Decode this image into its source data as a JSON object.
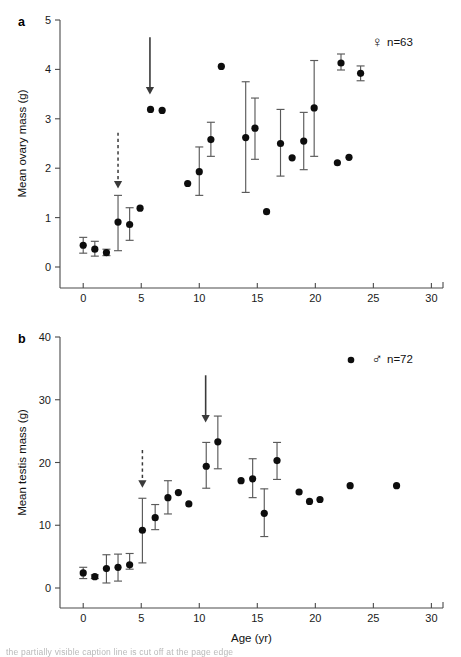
{
  "figure": {
    "width": 461,
    "height": 657,
    "background": "#ffffff",
    "ink": "#111111",
    "marker_color": "#0d0d0d",
    "errorbar_color": "#5a5a5a",
    "arrow_color": "#3a3a3a",
    "bottom_caption": "the partially visible caption line is cut off at the page edge"
  },
  "shared": {
    "xlabel": "Age (yr)",
    "x_ticks": [
      0,
      5,
      10,
      15,
      20,
      25,
      30
    ],
    "xlim": [
      -2,
      31
    ]
  },
  "chart_data": [
    {
      "id": "panel-a",
      "type": "scatter",
      "panel_label": "a",
      "title": "",
      "xlabel": "",
      "ylabel": "Mean ovary mass (g)",
      "xlim": [
        -2,
        31
      ],
      "ylim": [
        0,
        5
      ],
      "x_ticks": [
        0,
        5,
        10,
        15,
        20,
        25,
        30
      ],
      "y_ticks": [
        0,
        1,
        2,
        3,
        4,
        5
      ],
      "grid": false,
      "legend_position": "top-right",
      "legend": {
        "symbol": "♀",
        "symbol_name": "female-symbol",
        "label": "n=63",
        "marker": "filled-circle-with-errorbar"
      },
      "series": [
        {
          "name": "Mean ovary mass",
          "marker": "filled-circle",
          "points": [
            {
              "x": 0.0,
              "y": 0.44,
              "err_low": 0.28,
              "err_high": 0.6
            },
            {
              "x": 1.0,
              "y": 0.36,
              "err_low": 0.22,
              "err_high": 0.52
            },
            {
              "x": 2.0,
              "y": 0.29,
              "err_low": 0.23,
              "err_high": 0.36
            },
            {
              "x": 3.0,
              "y": 0.91,
              "err_low": 0.33,
              "err_high": 1.45
            },
            {
              "x": 4.0,
              "y": 0.86,
              "err_low": 0.54,
              "err_high": 1.2
            },
            {
              "x": 4.9,
              "y": 1.19,
              "err_low": null,
              "err_high": null
            },
            {
              "x": 5.8,
              "y": 3.19,
              "err_low": null,
              "err_high": null
            },
            {
              "x": 6.8,
              "y": 3.17,
              "err_low": null,
              "err_high": null
            },
            {
              "x": 9.0,
              "y": 1.69,
              "err_low": null,
              "err_high": null
            },
            {
              "x": 10.0,
              "y": 1.93,
              "err_low": 1.45,
              "err_high": 2.43
            },
            {
              "x": 11.0,
              "y": 2.58,
              "err_low": 2.24,
              "err_high": 2.93
            },
            {
              "x": 11.9,
              "y": 4.06,
              "err_low": null,
              "err_high": null
            },
            {
              "x": 14.0,
              "y": 2.62,
              "err_low": 1.51,
              "err_high": 3.75
            },
            {
              "x": 14.8,
              "y": 2.81,
              "err_low": 2.18,
              "err_high": 3.42
            },
            {
              "x": 15.8,
              "y": 1.12,
              "err_low": null,
              "err_high": null
            },
            {
              "x": 17.0,
              "y": 2.5,
              "err_low": 1.84,
              "err_high": 3.19
            },
            {
              "x": 18.0,
              "y": 2.21,
              "err_low": null,
              "err_high": null
            },
            {
              "x": 19.0,
              "y": 2.55,
              "err_low": 1.97,
              "err_high": 3.13
            },
            {
              "x": 19.9,
              "y": 3.22,
              "err_low": 2.24,
              "err_high": 4.18
            },
            {
              "x": 21.9,
              "y": 2.11,
              "err_low": null,
              "err_high": null
            },
            {
              "x": 22.9,
              "y": 2.22,
              "err_low": null,
              "err_high": null
            },
            {
              "x": 23.9,
              "y": 3.92,
              "err_low": 3.77,
              "err_high": 4.07
            }
          ]
        }
      ],
      "annotations": [
        {
          "name": "solid-arrow",
          "style": "solid",
          "x": 5.75,
          "y_top": 4.65,
          "y_tip": 3.52
        },
        {
          "name": "dashed-arrow",
          "style": "dashed",
          "x": 3.0,
          "y_top": 2.72,
          "y_tip": 1.62
        }
      ]
    },
    {
      "id": "panel-b",
      "type": "scatter",
      "panel_label": "b",
      "title": "",
      "xlabel": "Age (yr)",
      "ylabel": "Mean testis mass (g)",
      "xlim": [
        -2,
        31
      ],
      "ylim": [
        0,
        40
      ],
      "x_ticks": [
        0,
        5,
        10,
        15,
        20,
        25,
        30
      ],
      "y_ticks": [
        0,
        10,
        20,
        30,
        40
      ],
      "grid": false,
      "legend_position": "top-right",
      "legend": {
        "symbol": "♂",
        "symbol_name": "male-symbol",
        "label": "n=72",
        "marker": "filled-circle"
      },
      "series": [
        {
          "name": "Mean testis mass",
          "marker": "filled-circle",
          "points": [
            {
              "x": 0.0,
              "y": 2.4,
              "err_low": 1.5,
              "err_high": 3.3
            },
            {
              "x": 1.0,
              "y": 1.8,
              "err_low": 1.5,
              "err_high": 2.1
            },
            {
              "x": 2.0,
              "y": 3.1,
              "err_low": 0.8,
              "err_high": 5.3
            },
            {
              "x": 3.0,
              "y": 3.3,
              "err_low": 1.1,
              "err_high": 5.4
            },
            {
              "x": 4.0,
              "y": 3.7,
              "err_low": 3.0,
              "err_high": 5.5
            },
            {
              "x": 5.1,
              "y": 9.2,
              "err_low": 4.0,
              "err_high": 14.3
            },
            {
              "x": 6.2,
              "y": 11.2,
              "err_low": 9.3,
              "err_high": 13.3
            },
            {
              "x": 7.3,
              "y": 14.4,
              "err_low": 11.8,
              "err_high": 17.1
            },
            {
              "x": 8.2,
              "y": 15.2,
              "err_low": null,
              "err_high": null
            },
            {
              "x": 9.1,
              "y": 13.4,
              "err_low": null,
              "err_high": null
            },
            {
              "x": 10.6,
              "y": 19.4,
              "err_low": 15.9,
              "err_high": 23.2
            },
            {
              "x": 11.6,
              "y": 23.3,
              "err_low": 19.0,
              "err_high": 27.4
            },
            {
              "x": 13.6,
              "y": 17.1,
              "err_low": null,
              "err_high": null
            },
            {
              "x": 14.6,
              "y": 17.4,
              "err_low": 14.4,
              "err_high": 20.6
            },
            {
              "x": 15.6,
              "y": 11.9,
              "err_low": 8.2,
              "err_high": 15.8
            },
            {
              "x": 16.7,
              "y": 20.3,
              "err_low": 17.3,
              "err_high": 23.2
            },
            {
              "x": 18.6,
              "y": 15.3,
              "err_low": null,
              "err_high": null
            },
            {
              "x": 19.5,
              "y": 13.8,
              "err_low": null,
              "err_high": null
            },
            {
              "x": 20.4,
              "y": 14.1,
              "err_low": null,
              "err_high": null
            },
            {
              "x": 23.0,
              "y": 16.3,
              "err_low": null,
              "err_high": null
            },
            {
              "x": 27.0,
              "y": 16.3,
              "err_low": null,
              "err_high": null
            }
          ]
        }
      ],
      "annotations": [
        {
          "name": "solid-arrow",
          "style": "solid",
          "x": 10.55,
          "y_top": 33.9,
          "y_tip": 26.6
        },
        {
          "name": "dashed-arrow",
          "style": "dashed",
          "x": 5.1,
          "y_top": 22.0,
          "y_tip": 16.2
        }
      ]
    }
  ]
}
